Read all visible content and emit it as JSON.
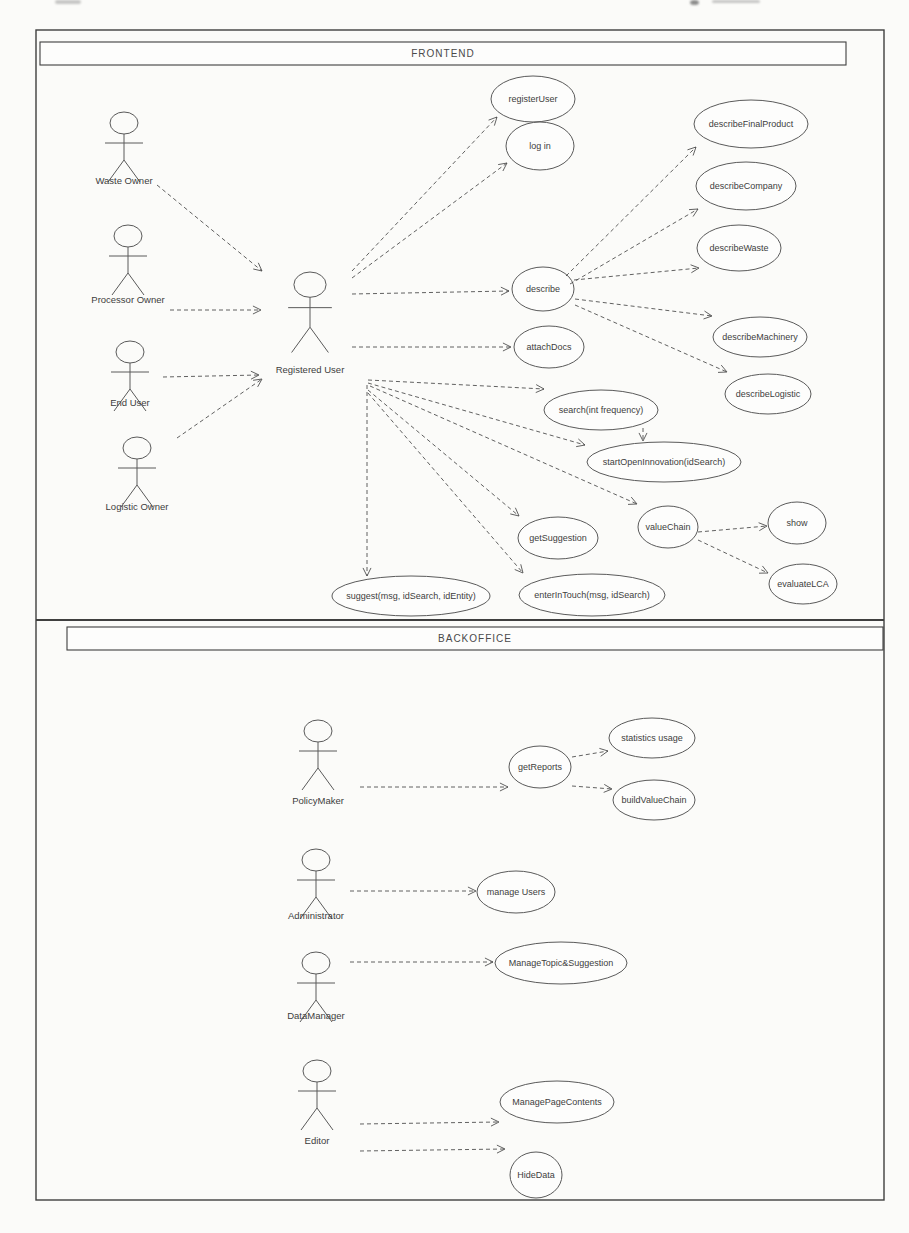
{
  "page": {
    "frontend_title": "FRONTEND",
    "backoffice_title": "BACKOFFICE"
  },
  "diagram": {
    "stroke_color": "#5a5a5a",
    "arrow_color": "#4f4f4f",
    "frame_color": "#3f3f3f",
    "text_color": "#3d3d3d",
    "frame": {
      "x": 36,
      "y": 30,
      "w": 848,
      "h": 1170
    },
    "frontend_bar": {
      "x": 40,
      "y": 42,
      "w": 806,
      "h": 23
    },
    "backoffice_bar": {
      "x": 67,
      "y": 627,
      "w": 816,
      "h": 23
    },
    "divider_y": 620,
    "actors": [
      {
        "id": "waste-owner",
        "label": "Waste Owner",
        "cx": 124,
        "top": 112,
        "label_y": 184,
        "s": 1
      },
      {
        "id": "processor-owner",
        "label": "Processor Owner",
        "cx": 128,
        "top": 225,
        "label_y": 303,
        "s": 1
      },
      {
        "id": "end-user",
        "label": "End User",
        "cx": 130,
        "top": 341,
        "label_y": 406,
        "s": 1
      },
      {
        "id": "logistic-owner",
        "label": "Logistic Owner",
        "cx": 137,
        "top": 437,
        "label_y": 510,
        "s": 1
      },
      {
        "id": "registered-user",
        "label": "Registered User",
        "cx": 310,
        "top": 272,
        "label_y": 373,
        "s": 1.15
      },
      {
        "id": "policy-maker",
        "label": "PolicyMaker",
        "cx": 318,
        "top": 720,
        "label_y": 804,
        "s": 1
      },
      {
        "id": "administrator",
        "label": "Administrator",
        "cx": 316,
        "top": 849,
        "label_y": 919,
        "s": 1
      },
      {
        "id": "data-manager",
        "label": "DataManager",
        "cx": 316,
        "top": 952,
        "label_y": 1019,
        "s": 1
      },
      {
        "id": "editor",
        "label": "Editor",
        "cx": 317,
        "top": 1060,
        "label_y": 1144,
        "s": 1
      }
    ],
    "usecases": [
      {
        "id": "register-user",
        "label": "registerUser",
        "cx": 533,
        "cy": 99,
        "rx": 42,
        "ry": 23
      },
      {
        "id": "login",
        "label": "log in",
        "cx": 540,
        "cy": 146,
        "rx": 34,
        "ry": 24
      },
      {
        "id": "describe-final-product",
        "label": "describeFinalProduct",
        "cx": 751,
        "cy": 124,
        "rx": 57,
        "ry": 24
      },
      {
        "id": "describe-company",
        "label": "describeCompany",
        "cx": 746,
        "cy": 186,
        "rx": 50,
        "ry": 24
      },
      {
        "id": "describe-waste",
        "label": "describeWaste",
        "cx": 739,
        "cy": 248,
        "rx": 42,
        "ry": 23
      },
      {
        "id": "describe",
        "label": "describe",
        "cx": 543,
        "cy": 289,
        "rx": 31,
        "ry": 22
      },
      {
        "id": "attach-docs",
        "label": "attachDocs",
        "cx": 549,
        "cy": 347,
        "rx": 35,
        "ry": 21
      },
      {
        "id": "describe-machinery",
        "label": "describeMachinery",
        "cx": 760,
        "cy": 337,
        "rx": 47,
        "ry": 20
      },
      {
        "id": "describe-logistic",
        "label": "describeLogistic",
        "cx": 768,
        "cy": 394,
        "rx": 43,
        "ry": 20
      },
      {
        "id": "search",
        "label": "search(int frequency)",
        "cx": 601,
        "cy": 410,
        "rx": 57,
        "ry": 20
      },
      {
        "id": "start-open-innovation",
        "label": "startOpenInnovation(idSearch)",
        "cx": 664,
        "cy": 462,
        "rx": 77,
        "ry": 20
      },
      {
        "id": "get-suggestion",
        "label": "getSuggestion",
        "cx": 558,
        "cy": 538,
        "rx": 40,
        "ry": 21
      },
      {
        "id": "value-chain",
        "label": "valueChain",
        "cx": 668,
        "cy": 527,
        "rx": 30,
        "ry": 21
      },
      {
        "id": "show",
        "label": "show",
        "cx": 797,
        "cy": 523,
        "rx": 29,
        "ry": 21
      },
      {
        "id": "evaluate-lca",
        "label": "evaluateLCA",
        "cx": 803,
        "cy": 584,
        "rx": 34,
        "ry": 20
      },
      {
        "id": "enter-in-touch",
        "label": "enterInTouch(msg, idSearch)",
        "cx": 592,
        "cy": 595,
        "rx": 73,
        "ry": 21
      },
      {
        "id": "suggest",
        "label": "suggest(msg, idSearch, idEntity)",
        "cx": 411,
        "cy": 596,
        "rx": 79,
        "ry": 20
      },
      {
        "id": "get-reports",
        "label": "getReports",
        "cx": 540,
        "cy": 767,
        "rx": 31,
        "ry": 21
      },
      {
        "id": "statistics-usage",
        "label": "statistics usage",
        "cx": 652,
        "cy": 738,
        "rx": 43,
        "ry": 20
      },
      {
        "id": "build-value-chain",
        "label": "buildValueChain",
        "cx": 654,
        "cy": 800,
        "rx": 41,
        "ry": 20
      },
      {
        "id": "manage-users",
        "label": "manage Users",
        "cx": 516,
        "cy": 892,
        "rx": 39,
        "ry": 21
      },
      {
        "id": "manage-topic-suggestion",
        "label": "ManageTopic&Suggestion",
        "cx": 561,
        "cy": 963,
        "rx": 66,
        "ry": 21
      },
      {
        "id": "manage-page-contents",
        "label": "ManagePageContents",
        "cx": 557,
        "cy": 1102,
        "rx": 57,
        "ry": 21
      },
      {
        "id": "hide-data",
        "label": "HideData",
        "cx": 536,
        "cy": 1175,
        "rx": 26,
        "ry": 23
      }
    ],
    "arrows": [
      {
        "name": "waste-owner-to-registered-user",
        "from": [
          157,
          185
        ],
        "to": [
          262,
          271
        ]
      },
      {
        "name": "processor-owner-to-registered-user",
        "from": [
          170,
          310
        ],
        "to": [
          261,
          310
        ]
      },
      {
        "name": "end-user-to-registered-user",
        "from": [
          163,
          377
        ],
        "to": [
          259,
          375
        ]
      },
      {
        "name": "logistic-owner-to-registered-user",
        "from": [
          177,
          438
        ],
        "to": [
          262,
          379
        ]
      },
      {
        "name": "registered-user-to-register-user",
        "from": [
          352,
          271
        ],
        "to": [
          497,
          117
        ]
      },
      {
        "name": "registered-user-to-login",
        "from": [
          352,
          278
        ],
        "to": [
          507,
          163
        ]
      },
      {
        "name": "registered-user-to-describe",
        "from": [
          352,
          294
        ],
        "to": [
          509,
          291
        ]
      },
      {
        "name": "registered-user-to-attach-docs",
        "from": [
          352,
          347
        ],
        "to": [
          511,
          347
        ]
      },
      {
        "name": "describe-to-describe-final-product",
        "from": [
          566,
          276
        ],
        "to": [
          696,
          147
        ]
      },
      {
        "name": "describe-to-describe-company",
        "from": [
          570,
          284
        ],
        "to": [
          698,
          209
        ]
      },
      {
        "name": "describe-to-describe-waste",
        "from": [
          574,
          280
        ],
        "to": [
          699,
          268
        ]
      },
      {
        "name": "describe-to-describe-machinery",
        "from": [
          575,
          299
        ],
        "to": [
          712,
          316
        ]
      },
      {
        "name": "describe-to-describe-logistic",
        "from": [
          575,
          305
        ],
        "to": [
          727,
          372
        ]
      },
      {
        "name": "registered-user-to-search",
        "from": [
          368,
          380
        ],
        "to": [
          544,
          389
        ]
      },
      {
        "name": "registered-user-to-start-open-innovation",
        "from": [
          368,
          383
        ],
        "to": [
          585,
          445
        ]
      },
      {
        "name": "registered-user-to-value-chain",
        "from": [
          370,
          386
        ],
        "to": [
          637,
          504
        ]
      },
      {
        "name": "registered-user-to-get-suggestion",
        "from": [
          368,
          390
        ],
        "to": [
          519,
          516
        ]
      },
      {
        "name": "registered-user-to-enter-in-touch",
        "from": [
          368,
          393
        ],
        "to": [
          523,
          573
        ]
      },
      {
        "name": "registered-user-to-suggest",
        "from": [
          367,
          385
        ],
        "to": [
          367,
          576
        ]
      },
      {
        "name": "search-to-start-open-innovation",
        "from": [
          643,
          428
        ],
        "to": [
          643,
          441
        ]
      },
      {
        "name": "value-chain-to-show",
        "from": [
          698,
          532
        ],
        "to": [
          767,
          526
        ]
      },
      {
        "name": "value-chain-to-evaluate-lca",
        "from": [
          698,
          540
        ],
        "to": [
          768,
          573
        ]
      },
      {
        "name": "policy-maker-to-get-reports",
        "from": [
          360,
          787
        ],
        "to": [
          508,
          787
        ]
      },
      {
        "name": "get-reports-to-statistics-usage",
        "from": [
          572,
          757
        ],
        "to": [
          608,
          751
        ]
      },
      {
        "name": "get-reports-to-build-value-chain",
        "from": [
          572,
          786
        ],
        "to": [
          612,
          789
        ]
      },
      {
        "name": "administrator-to-manage-users",
        "from": [
          350,
          891
        ],
        "to": [
          476,
          891
        ]
      },
      {
        "name": "data-manager-to-manage-topic-suggestion",
        "from": [
          350,
          962
        ],
        "to": [
          493,
          962
        ]
      },
      {
        "name": "editor-to-manage-page-contents",
        "from": [
          360,
          1124
        ],
        "to": [
          499,
          1122
        ]
      },
      {
        "name": "editor-to-hide-data",
        "from": [
          360,
          1151
        ],
        "to": [
          505,
          1149
        ]
      }
    ]
  }
}
